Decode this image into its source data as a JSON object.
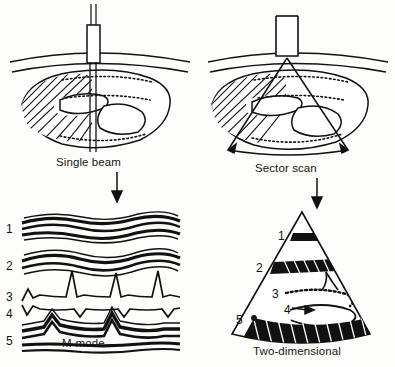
{
  "figure": {
    "kind": "echocardiography-modes-diagram",
    "ink_color": "#111111",
    "paper_color": "#fdfdfb"
  },
  "panels": {
    "top_left": {
      "caption": "Single beam",
      "transducer": "single-element-probe",
      "beam_type": "single straight beam"
    },
    "top_right": {
      "caption": "Sector scan",
      "transducer": "sector-probe",
      "beam_type": "fan shaped sector"
    },
    "bottom_left": {
      "caption": "M-mode",
      "trace_labels": [
        "1",
        "2",
        "3",
        "4",
        "5"
      ]
    },
    "bottom_right": {
      "caption": "Two-dimensional",
      "structure_labels": [
        "1",
        "2",
        "3",
        "4",
        "5"
      ]
    }
  },
  "arrows": {
    "left": "down-arrow",
    "right": "down-arrow"
  }
}
